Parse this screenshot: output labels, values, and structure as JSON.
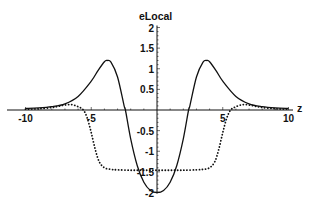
{
  "chart_data": {
    "type": "line",
    "title": "",
    "xlabel": "z",
    "ylabel": "eLocal",
    "xlim": [
      -10,
      10
    ],
    "ylim": [
      -2,
      2
    ],
    "grid": false,
    "legend": null,
    "x_ticks": [
      -10,
      -5,
      5,
      10
    ],
    "x_tick_labels": [
      "-10",
      "-5",
      "5",
      "10"
    ],
    "y_ticks": [
      2,
      1.5,
      1,
      0.5,
      -0.5,
      -1,
      -1.5,
      -2
    ],
    "y_tick_labels": [
      "2",
      "1.5",
      "1",
      "0.5",
      "-0.5",
      "-1",
      "-1.5",
      "-2"
    ],
    "series": [
      {
        "name": "solid",
        "style": "solid",
        "x": [
          -10,
          -9,
          -8,
          -7,
          -6,
          -5,
          -4.5,
          -4,
          -3.8,
          -3.5,
          -3,
          -2.5,
          -2.4,
          -2,
          -1.5,
          -1,
          -0.5,
          0,
          0.5,
          1,
          1.5,
          2,
          2.4,
          2.5,
          3,
          3.5,
          3.8,
          4,
          4.5,
          5,
          6,
          7,
          8,
          9,
          10
        ],
        "y": [
          0.04,
          0.05,
          0.08,
          0.15,
          0.33,
          0.7,
          0.95,
          1.17,
          1.2,
          1.16,
          0.8,
          0.1,
          0.0,
          -0.7,
          -1.35,
          -1.75,
          -1.95,
          -2.0,
          -1.95,
          -1.75,
          -1.35,
          -0.7,
          0.0,
          0.1,
          0.8,
          1.16,
          1.2,
          1.17,
          0.95,
          0.7,
          0.33,
          0.15,
          0.08,
          0.05,
          0.04
        ]
      },
      {
        "name": "dotted",
        "style": "dotted",
        "x": [
          -10,
          -9,
          -8,
          -7.5,
          -7,
          -6.5,
          -6,
          -5.6,
          -5.3,
          -5,
          -4.7,
          -4.4,
          -4,
          -3.5,
          -3,
          -2,
          -1,
          0,
          1,
          2,
          3,
          3.5,
          4,
          4.4,
          4.7,
          5,
          5.3,
          5.6,
          6,
          6.5,
          7,
          7.5,
          8,
          9,
          10
        ],
        "y": [
          0.02,
          0.03,
          0.06,
          0.09,
          0.12,
          0.13,
          0.08,
          0.0,
          -0.2,
          -0.55,
          -0.95,
          -1.25,
          -1.4,
          -1.44,
          -1.45,
          -1.46,
          -1.46,
          -1.46,
          -1.46,
          -1.46,
          -1.45,
          -1.44,
          -1.4,
          -1.25,
          -0.95,
          -0.55,
          -0.2,
          0.0,
          0.08,
          0.13,
          0.12,
          0.09,
          0.06,
          0.03,
          0.02
        ]
      }
    ]
  },
  "layout": {
    "plot": {
      "x0_px": 157,
      "y0_px": 110,
      "px_per_x": 13.15,
      "px_per_y": 41.25
    },
    "colors": {
      "line": "#111111",
      "axis": "#111111",
      "background": "#ffffff"
    }
  }
}
